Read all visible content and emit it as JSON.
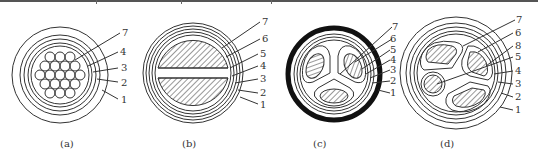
{
  "figure": {
    "panels": [
      {
        "id": "a",
        "caption": "(a)",
        "labels": [
          "7",
          "4",
          "3",
          "2",
          "1"
        ]
      },
      {
        "id": "b",
        "caption": "(b)",
        "labels": [
          "7",
          "6",
          "5",
          "4",
          "3",
          "2",
          "1"
        ]
      },
      {
        "id": "c",
        "caption": "(c)",
        "labels": [
          "7",
          "6",
          "5",
          "4",
          "3",
          "2",
          "1"
        ]
      },
      {
        "id": "d",
        "caption": "(d)",
        "labels": [
          "7",
          "6",
          "8",
          "5",
          "4",
          "3",
          "2",
          "1"
        ]
      }
    ]
  },
  "colors": {
    "line": "#333333",
    "sheath_c": "#111111"
  }
}
